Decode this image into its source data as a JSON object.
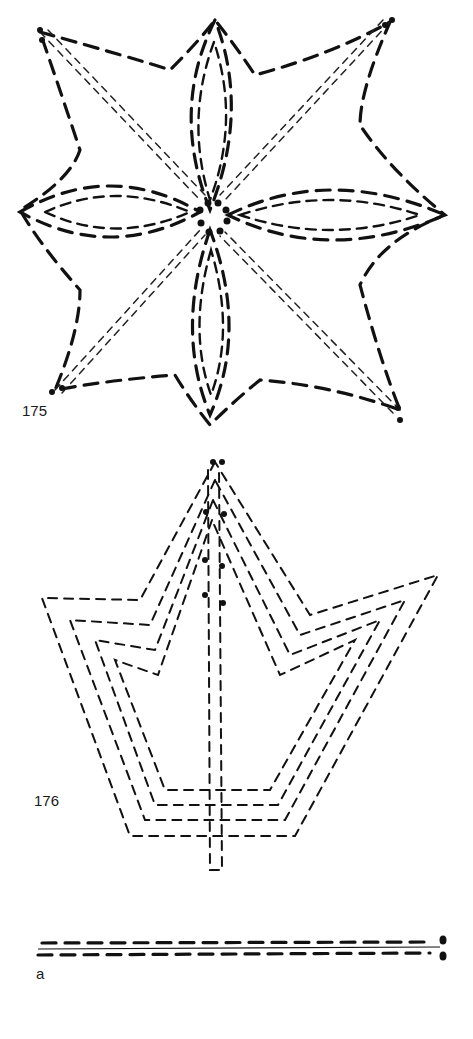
{
  "figures": [
    {
      "id": "175",
      "label": "175",
      "description": "eight-pointed star flower stitch pattern"
    },
    {
      "id": "176",
      "label": "176",
      "description": "crown/leaf stitch pattern with central stem"
    },
    {
      "id": "a",
      "label": "a",
      "description": "parallel dashed stitch lines with end holes"
    }
  ],
  "colors": {
    "ink": "#111111",
    "paper": "#ffffff"
  }
}
